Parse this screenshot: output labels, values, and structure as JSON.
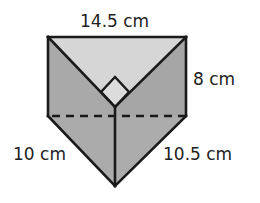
{
  "figure": {
    "type": "triangular-prism",
    "labels": {
      "top_edge": "14.5 cm",
      "height": "8 cm",
      "left_leg": "10 cm",
      "right_leg": "10.5 cm"
    },
    "right_angle_marker": true,
    "hidden_edge": "dashed"
  },
  "colors": {
    "top_face": "#d6d6d6",
    "left_face": "#a9a9a9",
    "right_face": "#a6a6a6",
    "lower_left_face": "#adadad",
    "lower_right_face": "#b1b1b1",
    "right_angle_fill": "#dcdcdc",
    "edge": "#1a1a1a",
    "text": "#222222"
  }
}
